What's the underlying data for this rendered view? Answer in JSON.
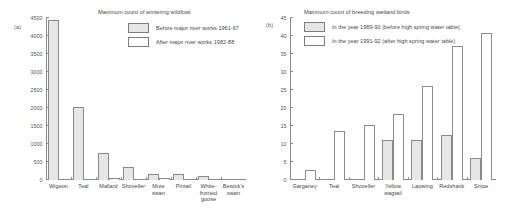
{
  "figure": {
    "panel_a_tag": "(a)",
    "panel_b_tag": "(b)"
  },
  "chart_data": [
    {
      "type": "bar",
      "panel": "(a)",
      "title": "Maximum count of wintering wildfowl",
      "xlabel": "",
      "ylabel": "",
      "ylim": [
        0,
        4500
      ],
      "yticks": [
        0,
        500,
        1000,
        1500,
        2000,
        2500,
        3000,
        3500,
        4000,
        4500
      ],
      "ytick_labels": [
        "0",
        "500",
        "1000",
        "1500",
        "2000",
        "2500",
        "3000",
        "3500",
        "4000",
        "4500"
      ],
      "grid": false,
      "legend_position": "top-right",
      "categories": [
        "Wigeon",
        "Teal",
        "Mallard",
        "Shoveller",
        "Mute swan",
        "Pintail",
        "White-fronted goose",
        "Bewick's swan"
      ],
      "category_lines": [
        [
          "Wigeon"
        ],
        [
          "Teal"
        ],
        [
          "Mallard"
        ],
        [
          "Shoveller"
        ],
        [
          "Mute",
          "swan"
        ],
        [
          "Pintail"
        ],
        [
          "White-",
          "fronted",
          "goose"
        ],
        [
          "Bewick's",
          "swan"
        ]
      ],
      "series": [
        {
          "name": "Before major river works 1961-67",
          "style": "shaded",
          "color": "#e6e6e6",
          "values": [
            4450,
            2030,
            760,
            360,
            180,
            165,
            125,
            0
          ]
        },
        {
          "name": "After major river works 1982-88",
          "style": "open",
          "color": "#ffffff",
          "values": [
            40,
            40,
            65,
            0,
            50,
            0,
            0,
            35
          ]
        }
      ]
    },
    {
      "type": "bar",
      "panel": "(b)",
      "title": "Maximum count of breeding wetland birds",
      "xlabel": "",
      "ylabel": "",
      "ylim": [
        0,
        45
      ],
      "yticks": [
        0,
        5,
        10,
        15,
        20,
        25,
        30,
        35,
        40,
        45
      ],
      "ytick_labels": [
        "0",
        "5",
        "10",
        "15",
        "20",
        "25",
        "30",
        "35",
        "40",
        "45"
      ],
      "grid": false,
      "legend_position": "top-right",
      "categories": [
        "Garganey",
        "Teal",
        "Shoveller",
        "Yellow wagtail",
        "Lapwing",
        "Redshank",
        "Snipe"
      ],
      "category_lines": [
        [
          "Garganey"
        ],
        [
          "Teal"
        ],
        [
          "Shoveller"
        ],
        [
          "Yellow",
          "wagtail"
        ],
        [
          "Lapwing"
        ],
        [
          "Redshank"
        ],
        [
          "Snipe"
        ]
      ],
      "series": [
        {
          "name": "In the year 1989-90 (before high spring water table)",
          "style": "shaded",
          "color": "#e6e6e6",
          "values": [
            0,
            0,
            0,
            11.2,
            11.1,
            12.6,
            6.1
          ]
        },
        {
          "name": "In the year 1991-92 (after high spring water table)",
          "style": "open",
          "color": "#ffffff",
          "values": [
            2.9,
            13.5,
            15.3,
            18.3,
            26.2,
            37.2,
            40.8
          ]
        }
      ]
    }
  ]
}
